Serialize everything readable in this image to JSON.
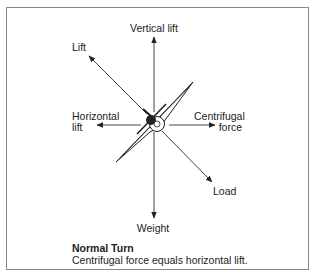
{
  "diagram": {
    "labels": {
      "vertical_lift": "Vertical lift",
      "lift": "Lift",
      "horizontal_lift_line1": "Horizontal",
      "horizontal_lift_line2": "lift",
      "centrifugal_line1": "Centrifugal",
      "centrifugal_line2": "force",
      "load": "Load",
      "weight": "Weight"
    },
    "caption": {
      "title": "Normal Turn",
      "text": "Centrifugal force equals horizontal lift."
    },
    "colors": {
      "line": "#333333",
      "border": "#8a8a8a",
      "text": "#222222"
    }
  }
}
